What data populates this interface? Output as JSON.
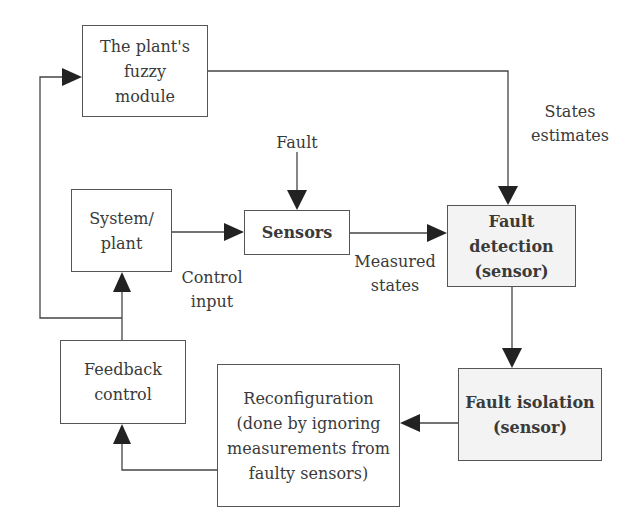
{
  "diagram": {
    "nodes": {
      "fuzzy_module": {
        "label": "The plant's\nfuzzy\nmodule"
      },
      "system_plant": {
        "label": "System/\nplant"
      },
      "sensors": {
        "label": "Sensors"
      },
      "fault_detection": {
        "label": "Fault\ndetection\n(sensor)"
      },
      "fault_isolation": {
        "label": "Fault isolation\n(sensor)"
      },
      "reconfiguration": {
        "label": "Reconfiguration\n(done by ignoring\nmeasurements from\nfaulty sensors)"
      },
      "feedback_control": {
        "label": "Feedback\ncontrol"
      }
    },
    "edge_labels": {
      "fault": "Fault",
      "states_estimates": "States\nestimates",
      "control_input": "Control\ninput",
      "measured_states": "Measured\nstates"
    },
    "edges": [
      {
        "from": "fault",
        "to": "sensors"
      },
      {
        "from": "system_plant",
        "to": "sensors"
      },
      {
        "from": "sensors",
        "to": "fault_detection",
        "label": "Measured states"
      },
      {
        "from": "fuzzy_module",
        "to": "fault_detection",
        "label": "States estimates"
      },
      {
        "from": "fault_detection",
        "to": "fault_isolation"
      },
      {
        "from": "fault_isolation",
        "to": "reconfiguration"
      },
      {
        "from": "reconfiguration",
        "to": "feedback_control"
      },
      {
        "from": "feedback_control",
        "to": "system_plant",
        "label": "Control input"
      },
      {
        "from": "feedback_control",
        "to": "fuzzy_module"
      }
    ],
    "colors": {
      "line": "#444444",
      "shaded_fill": "#f3f3f3"
    }
  }
}
